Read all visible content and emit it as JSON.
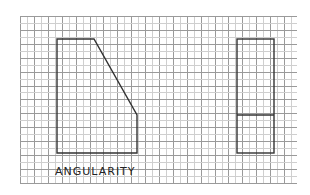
{
  "diagram": {
    "title": "ANGULARITY",
    "colors": {
      "background": "#ffffff",
      "grid_dark": "#9a9a9a",
      "grid_light": "#cfcfcf",
      "outline": "#333333",
      "text": "#222222"
    },
    "grid": {
      "x0": 20,
      "y0": 16,
      "x1": 297,
      "y1": 183,
      "spacing": 6.95
    },
    "front_view": {
      "name": "front-view-angled-shape",
      "points": [
        [
          57,
          39
        ],
        [
          94,
          39
        ],
        [
          137,
          115
        ],
        [
          137,
          153
        ],
        [
          57,
          153
        ]
      ]
    },
    "side_view": {
      "name": "side-view-rectangle",
      "rect": {
        "x": 237,
        "y": 39,
        "w": 37,
        "h": 114
      },
      "divider_y": 115
    },
    "label": {
      "text": "ANGULARITY",
      "x": 55,
      "y": 165
    }
  }
}
